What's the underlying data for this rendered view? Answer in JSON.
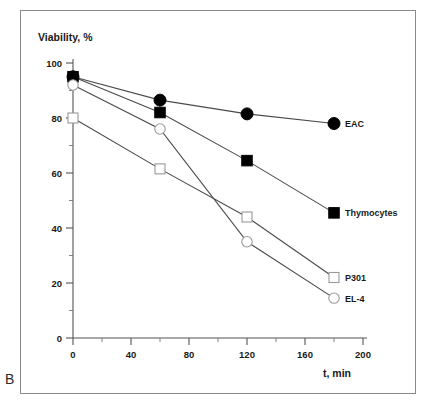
{
  "panel": {
    "letter": "B"
  },
  "chart_data": {
    "type": "line",
    "title": "",
    "xlabel": "t, min",
    "ylabel": "Viability, %",
    "xlim": [
      0,
      200
    ],
    "ylim": [
      0,
      100
    ],
    "xticks": [
      0,
      40,
      80,
      120,
      160,
      200
    ],
    "xtick_labels": [
      "0",
      "40",
      "80",
      "120",
      "160",
      "200"
    ],
    "xminor_step": 20,
    "yticks": [
      0,
      20,
      40,
      60,
      80,
      100
    ],
    "ytick_labels": [
      "0",
      "20",
      "40",
      "60",
      "80",
      "100"
    ],
    "yminor_step": 10,
    "grid": false,
    "legend_position": "right-of-endpoint",
    "x": [
      0,
      60,
      120,
      180
    ],
    "series": [
      {
        "name": "EAC",
        "marker": "filled-circle",
        "values": [
          95,
          86.5,
          81.5,
          78
        ]
      },
      {
        "name": "Thymocytes",
        "marker": "filled-square",
        "values": [
          95,
          82,
          64.5,
          45.5
        ]
      },
      {
        "name": "P301",
        "marker": "open-square",
        "values": [
          80,
          61.5,
          44,
          22
        ]
      },
      {
        "name": "EL-4",
        "marker": "open-circle",
        "values": [
          92,
          76,
          35,
          14.5
        ]
      }
    ]
  },
  "axis_titles": {
    "y": "Viability, %",
    "x": "t, min"
  },
  "series_labels": {
    "eac": "EAC",
    "thymocytes": "Thymocytes",
    "p301": "P301",
    "el4": "EL-4"
  }
}
